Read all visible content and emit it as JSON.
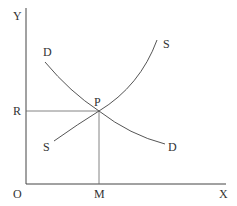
{
  "diagram": {
    "type": "supply-demand",
    "axes": {
      "y_label": "Y",
      "x_label": "X",
      "origin_label": "O"
    },
    "curves": {
      "demand": {
        "label_start": "D",
        "label_end": "D"
      },
      "supply": {
        "label_start": "S",
        "label_end": "S"
      }
    },
    "equilibrium": {
      "point_label": "P",
      "price_label": "R",
      "quantity_label": "M"
    },
    "colors": {
      "line": "#555555",
      "axis": "#444444",
      "text": "#333333"
    }
  }
}
